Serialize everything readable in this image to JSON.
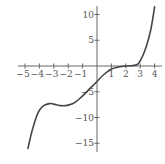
{
  "chart_data": {
    "type": "line",
    "title": "",
    "xlabel": "",
    "ylabel": "",
    "xlim": [
      -5.3,
      4.3
    ],
    "ylim": [
      -16.5,
      12
    ],
    "grid": false,
    "legend": null,
    "x_ticks": [
      -5,
      -4,
      -3,
      -2,
      -1,
      1,
      2,
      3,
      4
    ],
    "x_tick_labels": [
      "−5",
      "−4",
      "−3",
      "−2",
      "−1",
      "1",
      "2",
      "3",
      "4"
    ],
    "y_ticks": [
      10,
      5,
      -5,
      -10,
      -15
    ],
    "y_tick_labels": [
      "10",
      "5",
      "−5",
      "−10",
      "−15"
    ],
    "series": [
      {
        "name": "f(x)",
        "color": "#444444",
        "x": [
          -4.8,
          -4.5,
          -4.2,
          -4.0,
          -3.7,
          -3.3,
          -3.0,
          -2.5,
          -2.0,
          -1.5,
          -1.0,
          -0.5,
          0.0,
          0.5,
          1.0,
          1.5,
          2.0,
          2.5,
          2.8,
          3.0,
          3.3,
          3.6,
          3.8,
          4.0
        ],
        "y": [
          -16.0,
          -12.5,
          -9.8,
          -8.6,
          -7.7,
          -7.3,
          -7.4,
          -7.7,
          -7.6,
          -7.0,
          -5.8,
          -4.4,
          -3.0,
          -1.6,
          -0.6,
          -0.2,
          0.0,
          0.1,
          0.3,
          1.0,
          2.8,
          5.5,
          8.0,
          11.5
        ]
      }
    ]
  }
}
